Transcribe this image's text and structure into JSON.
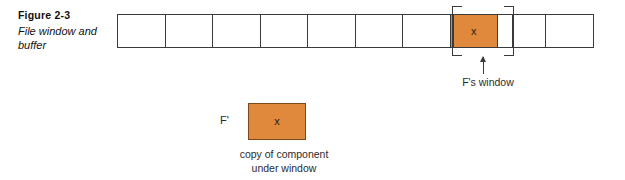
{
  "figure": {
    "number": "Figure 2-3",
    "title": "File window and buffer"
  },
  "strip": {
    "cells": [
      {
        "mark": "",
        "highlighted": false
      },
      {
        "mark": "",
        "highlighted": false
      },
      {
        "mark": "",
        "highlighted": false
      },
      {
        "mark": "",
        "highlighted": false
      },
      {
        "mark": "",
        "highlighted": false
      },
      {
        "mark": "",
        "highlighted": false
      },
      {
        "mark": "",
        "highlighted": false
      },
      {
        "mark": "x",
        "highlighted": true
      },
      {
        "mark": "",
        "highlighted": false
      },
      {
        "mark": "",
        "highlighted": false
      }
    ],
    "highlight_color": "#E0883C",
    "border_color": "#3a3a3a"
  },
  "window_annotation": {
    "label": "F's window"
  },
  "buffer": {
    "label": "F'",
    "mark": "x",
    "caption_line1": "copy of component",
    "caption_line2": "under window",
    "color": "#E0883C"
  }
}
